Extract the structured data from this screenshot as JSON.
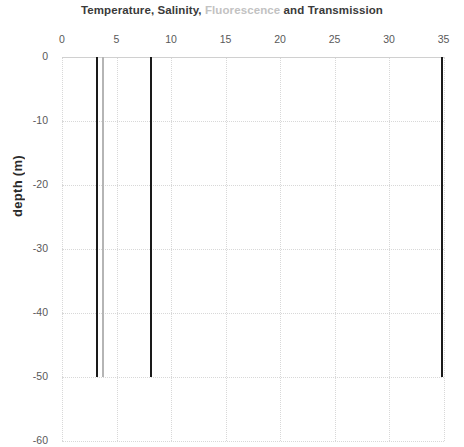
{
  "chart_data": {
    "type": "line",
    "orientation": "vertical-profile",
    "title": "Temperature, Salinity, Fluorescence and Transmission",
    "title_parts": [
      {
        "text": "Temperature, Salinity, ",
        "color": "#3a3a3a"
      },
      {
        "text": "Fluorescence",
        "color": "#c2c2c2"
      },
      {
        "text": " and Transmission",
        "color": "#3a3a3a"
      }
    ],
    "xlabel": "",
    "ylabel": "depth (m)",
    "xlim": [
      0,
      35
    ],
    "ylim": [
      -60,
      0
    ],
    "x_ticks": [
      0,
      5,
      10,
      15,
      20,
      25,
      30,
      35
    ],
    "y_ticks": [
      0,
      -10,
      -20,
      -30,
      -40,
      -50,
      -60
    ],
    "x_axis_position": "top",
    "grid": true,
    "grid_style": "dotted",
    "grid_color": "#d8d8d8",
    "legend": "none",
    "depth_range_of_data": [
      0,
      -50
    ],
    "series": [
      {
        "name": "Temperature",
        "color": "#1a1a1a",
        "value": 3.2,
        "depth_top": 0,
        "depth_bottom": -50
      },
      {
        "name": "Fluorescence",
        "color": "#b5b5b5",
        "value": 3.8,
        "depth_top": 0,
        "depth_bottom": -50
      },
      {
        "name": "Salinity",
        "color": "#1a1a1a",
        "value": 8.2,
        "depth_top": 0,
        "depth_bottom": -50
      },
      {
        "name": "Transmission",
        "color": "#1a1a1a",
        "value": 34.9,
        "depth_top": 0,
        "depth_bottom": -50
      }
    ]
  }
}
